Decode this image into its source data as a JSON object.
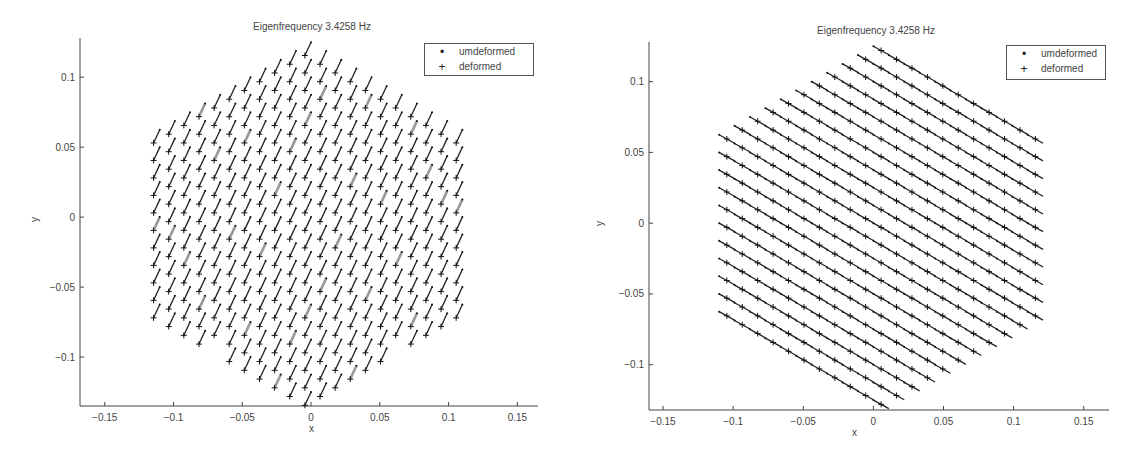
{
  "chart_data": [
    {
      "type": "scatter",
      "title": "Eigenfrequency 3.4258 Hz",
      "xlabel": "x",
      "ylabel": "y",
      "xlim": [
        -0.168,
        0.165
      ],
      "ylim": [
        -0.135,
        0.128
      ],
      "xticks": [
        -0.15,
        -0.1,
        -0.05,
        0,
        0.05,
        0.1,
        0.15
      ],
      "xtick_labels": [
        "-0.15",
        "-0.1",
        "-0.05",
        "0",
        "0.05",
        "0.1",
        "0.15"
      ],
      "yticks": [
        -0.1,
        -0.05,
        0,
        0.05,
        0.1
      ],
      "ytick_labels": [
        "-0.1",
        "-0.05",
        "0",
        "0.05",
        "0.1"
      ],
      "grid": false,
      "legend": {
        "position": "upper right",
        "entries": [
          {
            "marker": "•",
            "label": "umdeformed"
          },
          {
            "marker": "+",
            "label": "deformed"
          }
        ]
      },
      "lattice": {
        "shape": "hexagon",
        "half_width": 0.11,
        "half_height": 0.125,
        "column_spacing": 0.011,
        "row_spacing": 0.0125
      },
      "mode_shape": {
        "dx": -0.0045,
        "dy": -0.0095,
        "connect": false
      },
      "series": [
        {
          "name": "umdeformed",
          "marker": "dot"
        },
        {
          "name": "deformed",
          "marker": "plus"
        }
      ]
    },
    {
      "type": "scatter",
      "title": "Eigenfrequency 3.4258 Hz",
      "xlabel": "x",
      "ylabel": "y",
      "xlim": [
        -0.16,
        0.168
      ],
      "ylim": [
        -0.132,
        0.128
      ],
      "xticks": [
        -0.15,
        -0.1,
        -0.05,
        0,
        0.05,
        0.1,
        0.15
      ],
      "xtick_labels": [
        "-0.15",
        "-0.1",
        "-0.05",
        "0",
        "0.05",
        "0.1",
        "0.15"
      ],
      "yticks": [
        -0.1,
        -0.05,
        0,
        0.05,
        0.1
      ],
      "ytick_labels": [
        "-0.1",
        "-0.05",
        "0",
        "0.05",
        "0.1"
      ],
      "grid": false,
      "legend": {
        "position": "upper right",
        "entries": [
          {
            "marker": "•",
            "label": "umdeformed"
          },
          {
            "marker": "+",
            "label": "deformed"
          }
        ]
      },
      "lattice": {
        "shape": "hexagon-sheared",
        "half_width": 0.115,
        "half_height": 0.125,
        "column_spacing": 0.011,
        "row_spacing": 0.0125
      },
      "mode_shape": {
        "dx": 0.0055,
        "dy": -0.003,
        "connect": true
      },
      "series": [
        {
          "name": "umdeformed",
          "marker": "dot"
        },
        {
          "name": "deformed",
          "marker": "plus"
        }
      ]
    }
  ]
}
